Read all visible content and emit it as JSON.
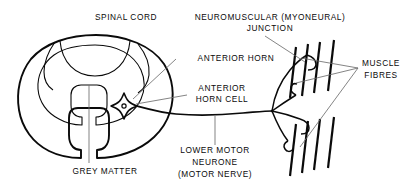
{
  "figure": {
    "ink_color": "#0a0a0a",
    "background_color": "#ffffff",
    "labels": {
      "spinal_cord": "SPINAL CORD",
      "neuromuscular_junction_line1": "NEUROMUSCULAR (MYONEURAL)",
      "neuromuscular_junction_line2": "JUNCTION",
      "anterior_horn": "ANTERIOR HORN",
      "anterior_horn_cell_line1": "ANTERIOR",
      "anterior_horn_cell_line2": "HORN CELL",
      "muscle_fibres_line1": "MUSCLE",
      "muscle_fibres_line2": "FIBRES",
      "lower_motor_neurone_line1": "LOWER MOTOR",
      "lower_motor_neurone_line2": "NEURONE",
      "lower_motor_neurone_line3": "(MOTOR NERVE)",
      "grey_matter": "GREY MATTER"
    },
    "structures": {
      "spinal_cord_outline": "oval cross-section with ventral median fissure notch",
      "grey_matter": "butterfly / H-shaped central grey matter",
      "anterior_horn_cell": "four-pointed star cell body with round nucleus",
      "axon": "single long fibre from horn cell running right, branching to two muscle fibre bundles",
      "muscle_fibre_bundle_upper_count": 4,
      "muscle_fibre_bundle_lower_count": 4,
      "neuromuscular_junction_count": 3
    }
  }
}
